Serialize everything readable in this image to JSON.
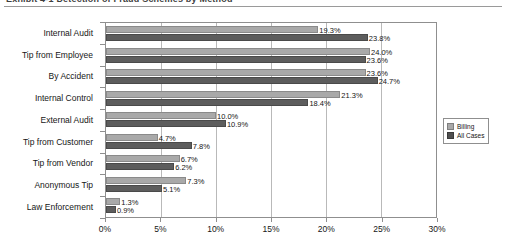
{
  "caption": {
    "text": "Exhibit 4-1   Detection of Fraud Schemes by Method"
  },
  "legend": {
    "items": [
      {
        "label": "Billing",
        "color": "#a9a9a9"
      },
      {
        "label": "All Cases",
        "color": "#4f4f4f"
      }
    ]
  },
  "chart_data": {
    "type": "bar",
    "orientation": "horizontal",
    "title": "",
    "xlabel": "",
    "ylabel": "",
    "xlim": [
      0,
      30
    ],
    "xticks": [
      "0%",
      "5%",
      "10%",
      "15%",
      "20%",
      "25%",
      "30%"
    ],
    "xtick_values": [
      0,
      5,
      10,
      15,
      20,
      25,
      30
    ],
    "grid": true,
    "legend_position": "right",
    "categories": [
      "Internal Audit",
      "Tip from Employee",
      "By Accident",
      "Internal Control",
      "External Audit",
      "Tip from Customer",
      "Tip from Vendor",
      "Anonymous Tip",
      "Law Enforcement"
    ],
    "series": [
      {
        "name": "Billing",
        "color": "#a9a9a9",
        "values": [
          19.3,
          24.0,
          23.6,
          21.3,
          10.0,
          4.7,
          6.7,
          7.3,
          1.3
        ],
        "labels": [
          "19.3%",
          "24.0%",
          "23.6%",
          "21.3%",
          "10.0%",
          "4.7%",
          "6.7%",
          "7.3%",
          "1.3%"
        ]
      },
      {
        "name": "All Cases",
        "color": "#4f4f4f",
        "values": [
          23.8,
          23.6,
          24.7,
          18.4,
          10.9,
          7.8,
          6.2,
          5.1,
          0.9
        ],
        "labels": [
          "23.8%",
          "23.6%",
          "24.7%",
          "18.4%",
          "10.9%",
          "7.8%",
          "6.2%",
          "5.1%",
          "0.9%"
        ]
      }
    ]
  }
}
